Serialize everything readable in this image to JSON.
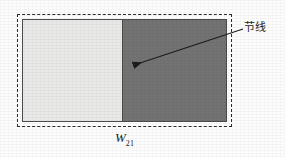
{
  "figure": {
    "background_color": "#fdfdfd"
  },
  "boundary": {
    "name": "dashed outer boundary",
    "style": "dashed",
    "color": "#2b2b2b"
  },
  "body": {
    "name": "rectangular block",
    "outline_color": "#4a4a4a",
    "regions": [
      {
        "id": "light",
        "label": "light region",
        "fill": "#e9e9e7",
        "width_fraction": 0.49
      },
      {
        "id": "dark",
        "label": "dark region",
        "fill": "#737373",
        "width_fraction": 0.51
      }
    ],
    "divider": {
      "label": "node line divider",
      "color": "#4a4a4a"
    }
  },
  "callout": {
    "label": "节线",
    "arrow": {
      "from_x": 243,
      "from_y": 29,
      "to_x": 131,
      "to_y": 66,
      "color": "#1c1c1c"
    }
  },
  "dimension": {
    "symbol": "W",
    "subscript": "21"
  }
}
